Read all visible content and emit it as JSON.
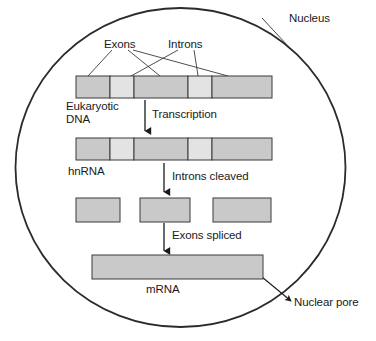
{
  "figure": {
    "type": "diagram",
    "width": 376,
    "height": 341
  },
  "colors": {
    "exon_fill": "#c9c9c9",
    "intron_fill": "#e3e3e3",
    "stroke": "#3a3a3a",
    "membrane_stroke": "#2b2b2b",
    "text": "#1a1a1a",
    "background": "#ffffff"
  },
  "labels": {
    "nucleus": "Nucleus",
    "exons": "Exons",
    "introns": "Introns",
    "eukaryotic_dna": "Eukaryotic\nDNA",
    "eukaryotic_dna_line1": "Eukaryotic",
    "eukaryotic_dna_line2": "DNA",
    "hnrna": "hnRNA",
    "mrna": "mRNA",
    "nuclear_pore": "Nuclear pore"
  },
  "steps": [
    {
      "id": "transcription",
      "label": "Transcription"
    },
    {
      "id": "introns-cleaved",
      "label": "Introns cleaved"
    },
    {
      "id": "exons-spliced",
      "label": "Exons spliced"
    }
  ],
  "molecules": [
    {
      "id": "eukaryotic-dna",
      "name": "Eukaryotic DNA",
      "segments": [
        {
          "type": "exon",
          "width_units": 60
        },
        {
          "type": "intron",
          "width_units": 30
        },
        {
          "type": "exon",
          "width_units": 55
        },
        {
          "type": "intron",
          "width_units": 30
        },
        {
          "type": "exon",
          "width_units": 61
        }
      ]
    },
    {
      "id": "hnrna",
      "name": "hnRNA",
      "segments": [
        {
          "type": "exon",
          "width_units": 60
        },
        {
          "type": "intron",
          "width_units": 30
        },
        {
          "type": "exon",
          "width_units": 55
        },
        {
          "type": "intron",
          "width_units": 30
        },
        {
          "type": "exon",
          "width_units": 61
        }
      ]
    },
    {
      "id": "cleaved-exons",
      "name": "Cleaved exons",
      "segments": [
        {
          "type": "exon",
          "width_units": 48
        },
        {
          "type": "exon",
          "width_units": 48
        },
        {
          "type": "exon",
          "width_units": 48
        }
      ]
    },
    {
      "id": "mrna",
      "name": "mRNA",
      "segments": [
        {
          "type": "exon",
          "width_units": 160
        }
      ]
    }
  ]
}
